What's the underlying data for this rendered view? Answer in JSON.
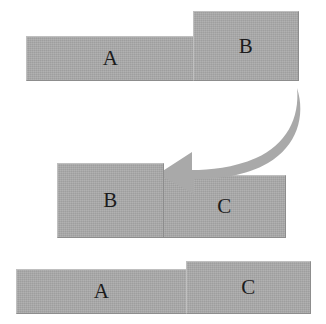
{
  "diagram": {
    "background_color": "#ffffff",
    "block_fill_color": "#a9a9a9",
    "label_color": "#1c1c1c",
    "arrow_color": "#a9a9a9",
    "rows": [
      {
        "name": "top-row",
        "blocks": [
          {
            "label": "A",
            "name": "block-a"
          },
          {
            "label": "B",
            "name": "block-b"
          }
        ]
      },
      {
        "name": "middle-row",
        "blocks": [
          {
            "label": "B",
            "name": "block-b"
          },
          {
            "label": "C",
            "name": "block-c"
          }
        ]
      },
      {
        "name": "bottom-row",
        "blocks": [
          {
            "label": "A",
            "name": "block-a"
          },
          {
            "label": "C",
            "name": "block-c"
          }
        ]
      }
    ],
    "arrow": {
      "name": "curved-move-arrow",
      "direction": "right-to-left-downward",
      "points_to": "middle-row-block-b"
    }
  }
}
